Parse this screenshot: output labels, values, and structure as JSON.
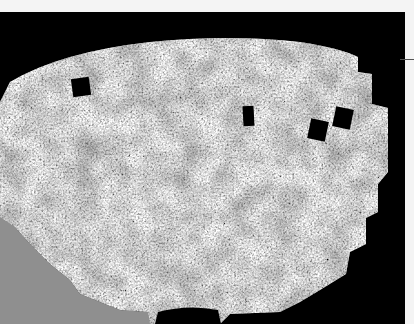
{
  "image": {
    "subject": "galaxy-survey-sky-map",
    "description": "Fan-shaped grey-speckled survey region with black rectangular masks on a black background",
    "colors": {
      "background": "#f4f4f4",
      "frame": "#000000",
      "survey_dark": "#3a3a3a",
      "survey_light": "#d8d8d8",
      "lower_left_fill": "#8f8f8f"
    },
    "masked_squares": [
      {
        "label": "mask-1",
        "x": 72,
        "y": 78,
        "w": 18,
        "h": 18
      },
      {
        "label": "mask-2",
        "x": 243,
        "y": 106,
        "w": 11,
        "h": 20
      },
      {
        "label": "mask-3",
        "x": 309,
        "y": 120,
        "w": 18,
        "h": 20
      },
      {
        "label": "mask-4",
        "x": 333,
        "y": 108,
        "w": 18,
        "h": 20
      },
      {
        "label": "bottom-notch",
        "x": 158,
        "y": 298,
        "w": 60,
        "h": 26
      }
    ]
  }
}
